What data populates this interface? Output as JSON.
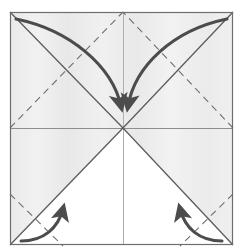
{
  "figure": {
    "title": "Origami preliminary-base crease pattern with fold arrows",
    "type": "origami-step-diagram",
    "canvas": {
      "width": 242,
      "height": 251
    }
  },
  "colors": {
    "background": "#ffffff",
    "paper_shaded": "#ededed",
    "paper_white": "#ffffff",
    "border": "#6e6e6e",
    "solid_crease": "#5a5a5a",
    "dashed_crease": "#707070",
    "thin_crease": "#9a9a9a",
    "arrow": "#4c4c4c"
  },
  "paper": {
    "label": "square-sheet",
    "left": 10,
    "top": 12,
    "right": 233,
    "bottom": 245,
    "center_x": 123,
    "center_y": 128
  },
  "creases": [
    {
      "name": "diagonal-top-left-to-center",
      "style": "solid-valley",
      "from": [
        10,
        12
      ],
      "to": [
        123,
        128
      ]
    },
    {
      "name": "diagonal-top-right-to-center",
      "style": "solid-valley",
      "from": [
        233,
        12
      ],
      "to": [
        123,
        128
      ]
    },
    {
      "name": "diagonal-bottom-left-to-center",
      "style": "solid-valley",
      "from": [
        10,
        245
      ],
      "to": [
        123,
        128
      ]
    },
    {
      "name": "diagonal-bottom-right-to-center",
      "style": "solid-valley",
      "from": [
        233,
        245
      ],
      "to": [
        123,
        128
      ]
    },
    {
      "name": "horizontal-midline",
      "style": "solid-thin",
      "from": [
        10,
        128
      ],
      "to": [
        233,
        128
      ]
    },
    {
      "name": "vertical-centerline",
      "style": "solid-thin",
      "from": [
        123,
        12
      ],
      "to": [
        123,
        245
      ]
    },
    {
      "name": "dashed-mountain-left-mid-to-top-center",
      "style": "dashed-mountain",
      "from": [
        10,
        128
      ],
      "to": [
        123,
        12
      ]
    },
    {
      "name": "dashed-mountain-right-mid-to-top-center",
      "style": "dashed-mountain",
      "from": [
        233,
        128
      ],
      "to": [
        123,
        12
      ]
    },
    {
      "name": "dashed-mountain-left-lower-corner",
      "style": "dashed-mountain",
      "from": [
        10,
        195
      ],
      "to": [
        62,
        245
      ]
    },
    {
      "name": "dashed-mountain-right-lower-corner",
      "style": "dashed-mountain",
      "from": [
        233,
        195
      ],
      "to": [
        181,
        245
      ]
    }
  ],
  "arrows": [
    {
      "name": "fold-arrow-top-left-to-center",
      "kind": "large-curved-fold-arrow",
      "direction": "down-right",
      "start": [
        16,
        18
      ],
      "end": [
        118,
        110
      ],
      "description": "Fold top-left corner down to center"
    },
    {
      "name": "fold-arrow-top-right-to-center",
      "kind": "large-curved-fold-arrow",
      "direction": "down-left",
      "start": [
        228,
        18
      ],
      "end": [
        130,
        110
      ],
      "description": "Fold top-right corner down to center"
    },
    {
      "name": "fold-arrow-bottom-left-up",
      "kind": "small-curved-fold-arrow",
      "direction": "up-right",
      "start": [
        22,
        241
      ],
      "end": [
        64,
        202
      ],
      "description": "Fold bottom-left edge upward"
    },
    {
      "name": "fold-arrow-bottom-right-up",
      "kind": "small-curved-fold-arrow",
      "direction": "up-left",
      "start": [
        221,
        241
      ],
      "end": [
        179,
        202
      ],
      "description": "Fold bottom-right edge upward"
    }
  ]
}
